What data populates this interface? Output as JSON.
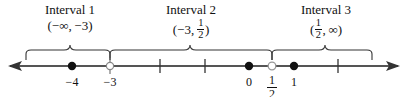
{
  "figure": {
    "type": "number-line-interval-diagram",
    "width": 407,
    "height": 97,
    "background": "#ffffff",
    "ink_color": "#111111",
    "axis_color": "#555555"
  },
  "number_line": {
    "y": 66,
    "left_arrow_tip_x": 8,
    "right_arrow_tip_x": 400,
    "left_arrow_label": "left-arrowhead",
    "right_arrow_label": "right-arrowhead"
  },
  "ticks": [
    {
      "x": 110,
      "label": "−3",
      "has_label": true,
      "marker": "open-circle"
    },
    {
      "x": 160,
      "label": "",
      "has_label": false,
      "marker": "none"
    },
    {
      "x": 205,
      "label": "",
      "has_label": false,
      "marker": "none"
    },
    {
      "x": 338,
      "label": "",
      "has_label": false,
      "marker": "none"
    }
  ],
  "points": [
    {
      "x": 72,
      "type": "filled",
      "label": "−4",
      "label_kind": "text"
    },
    {
      "x": 110,
      "type": "open",
      "label": "−3",
      "label_kind": "text"
    },
    {
      "x": 249,
      "type": "filled",
      "label": "0",
      "label_kind": "text"
    },
    {
      "x": 272,
      "type": "open",
      "label": "1/2",
      "label_kind": "fraction",
      "numerator": "1",
      "denominator": "2"
    },
    {
      "x": 294,
      "type": "filled",
      "label": "1",
      "label_kind": "text"
    }
  ],
  "intervals": [
    {
      "id": "interval-1",
      "title": "Interval 1",
      "notation_open": "(",
      "notation_left": "−∞",
      "notation_comma": ",",
      "notation_right": "−3",
      "notation_close": ")",
      "notation_plain": "(−∞, −3)",
      "brace_left_x": 26,
      "brace_right_x": 110,
      "brace_peak_x": 70,
      "label_center_x": 70,
      "title_y": 3,
      "notation_y": 19
    },
    {
      "id": "interval-2",
      "title": "Interval 2",
      "notation_open": "(",
      "notation_left": "−3",
      "notation_comma": ",",
      "notation_right_numerator": "1",
      "notation_right_denominator": "2",
      "notation_close": ")",
      "notation_plain": "(−3, 1/2)",
      "brace_left_x": 110,
      "brace_right_x": 272,
      "brace_peak_x": 190,
      "label_center_x": 191,
      "title_y": 3,
      "notation_y": 19
    },
    {
      "id": "interval-3",
      "title": "Interval 3",
      "notation_open": "(",
      "notation_left_numerator": "1",
      "notation_left_denominator": "2",
      "notation_comma": ",",
      "notation_right": "∞",
      "notation_close": ")",
      "notation_plain": "(1/2, ∞)",
      "brace_left_x": 272,
      "brace_right_x": 372,
      "brace_peak_x": 325,
      "label_center_x": 326,
      "title_y": 3,
      "notation_y": 19
    }
  ]
}
